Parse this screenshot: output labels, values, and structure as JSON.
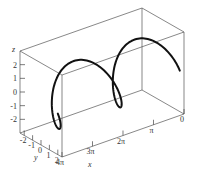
{
  "chart_data": {
    "type": "line",
    "subtype": "3d-parametric-curve",
    "title": "",
    "parametric": {
      "t_range": [
        0,
        12.566
      ],
      "x": "t",
      "y": "2*cos(t)",
      "z": "2*sin(t)",
      "samples": 200
    },
    "axes": {
      "x": {
        "label": "x",
        "range": [
          0,
          12.566
        ],
        "ticks": [
          0,
          3.1416,
          6.2832,
          9.4248,
          12.566
        ],
        "tick_labels": [
          "0",
          "π",
          "2π",
          "3π",
          "4π"
        ]
      },
      "y": {
        "label": "y",
        "range": [
          -2.5,
          2.5
        ],
        "ticks": [
          -2,
          -1,
          0,
          1,
          2
        ],
        "tick_labels": [
          "-2",
          "-1",
          "0",
          "1",
          "2"
        ]
      },
      "z": {
        "label": "z",
        "range": [
          -3,
          3
        ],
        "ticks": [
          -2,
          -1,
          0,
          1,
          2
        ],
        "tick_labels": [
          "-2",
          "-1",
          "0",
          "1",
          "2"
        ]
      }
    },
    "grid": false,
    "box": true,
    "colors": {
      "curve": "#111111",
      "box": "#555555"
    }
  }
}
